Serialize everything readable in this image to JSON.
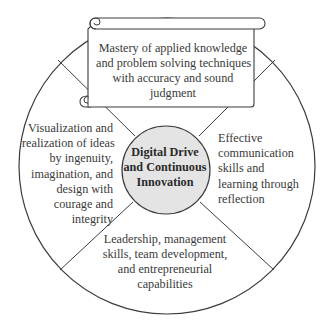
{
  "diagram": {
    "type": "circular-quadrant-diagram",
    "center": {
      "label_lines": [
        "Digital Drive",
        "and Continuous",
        "Innovation"
      ],
      "fill": "#e4e4e4"
    },
    "segments": {
      "top": {
        "label_lines": [
          "Mastery of applied knowledge",
          "and problem solving techniques",
          "with accuracy and sound",
          "judgment"
        ],
        "container": "scroll"
      },
      "left": {
        "label_lines": [
          "Visualization and",
          "realization of ideas",
          "by ingenuity,",
          "imagination, and",
          "design with",
          "courage and",
          "integrity"
        ]
      },
      "right": {
        "label_lines": [
          "Effective",
          "communication",
          "skills and",
          "learning through",
          "reflection"
        ]
      },
      "bottom": {
        "label_lines": [
          "Leadership, management",
          "skills, team development,",
          "and entrepreneurial",
          "capabilities"
        ]
      }
    },
    "colors": {
      "stroke": "#3c3c3c",
      "background": "#ffffff",
      "text": "#3a3a3a"
    }
  }
}
